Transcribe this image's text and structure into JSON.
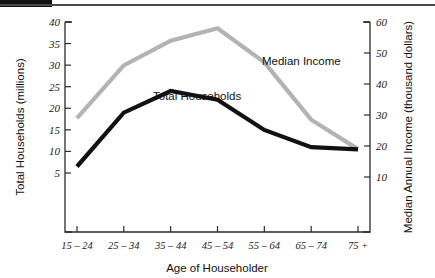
{
  "chart_data": {
    "type": "line",
    "title": "",
    "xlabel": "Age of Householder",
    "categories": [
      "15 – 24",
      "25 – 34",
      "35 – 44",
      "45 – 54",
      "55 – 64",
      "65 – 74",
      "75 +"
    ],
    "grid": false,
    "legend_position": "inline-annotations",
    "axes": {
      "left": {
        "label": "Total Households (millions)",
        "ticks": [
          5,
          10,
          15,
          20,
          25,
          30,
          35,
          40
        ],
        "tick_labels": [
          "5",
          "10",
          "15",
          "20",
          "25",
          "30",
          "35",
          "40"
        ],
        "ylim": [
          0,
          40
        ]
      },
      "right": {
        "label": "Median Annual Income (thousand dollars)",
        "ticks": [
          10,
          20,
          30,
          40,
          50,
          60
        ],
        "tick_labels": [
          "10",
          "20",
          "30",
          "40",
          "50",
          "60"
        ],
        "ylim": [
          0,
          60
        ]
      }
    },
    "series": [
      {
        "name": "Total Households",
        "axis": "left",
        "color": "#111111",
        "values": [
          6.5,
          19,
          24,
          22,
          15,
          11,
          10.5
        ]
      },
      {
        "name": "Median Income",
        "axis": "right",
        "color": "#b3b3b3",
        "values": [
          29,
          46,
          54,
          58,
          47,
          28.5,
          19
        ]
      }
    ],
    "annotations": [
      {
        "text": "Total Households",
        "x_px": 153,
        "y_px": 90
      },
      {
        "text": "Median Income",
        "x_px": 262,
        "y_px": 55
      }
    ]
  }
}
